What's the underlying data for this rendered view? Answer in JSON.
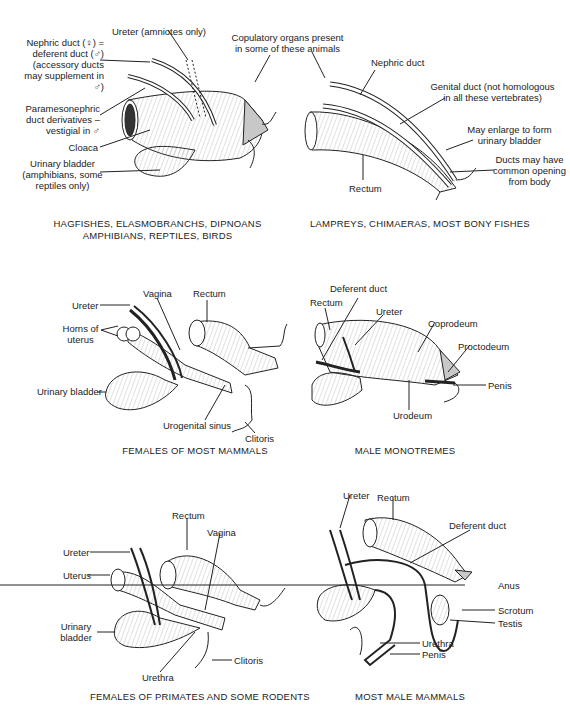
{
  "panels": [
    {
      "id": "nonmammal-tetrapods",
      "caption": "HAGFISHES, ELASMOBRANCHS, DIPNOANS\nAMPHIBIANS, REPTILES, BIRDS",
      "labels": {
        "ureter": "Ureter (amniotes only)",
        "nephric_duct": "Nephric duct (♀) =\ndeferent duct (♂)\n(accessory ducts\nmay supplement in ♂)",
        "paramesonephric": "Paramesonephric\nduct derivatives –\nvestigial in ♂",
        "cloaca": "Cloaca",
        "urinary_bladder": "Urinary bladder\n(amphibians, some\nreptiles only)"
      }
    },
    {
      "id": "fishes",
      "caption": "LAMPREYS, CHIMAERAS, MOST BONY FISHES",
      "labels": {
        "nephric_duct": "Nephric duct",
        "genital_duct": "Genital duct (not homologous\nin all these vertebrates)",
        "may_enlarge": "May enlarge to form\nurinary bladder",
        "ducts_common": "Ducts may have\ncommon opening\nfrom body",
        "rectum": "Rectum"
      }
    },
    {
      "id": "females-most-mammals",
      "caption": "FEMALES OF MOST MAMMALS",
      "labels": {
        "vagina": "Vagina",
        "rectum": "Rectum",
        "ureter": "Ureter",
        "horns": "Horns of\nuterus",
        "urinary_bladder": "Urinary bladder",
        "urogenital_sinus": "Urogenital sinus",
        "clitoris": "Clitoris"
      }
    },
    {
      "id": "male-monotremes",
      "caption": "MALE MONOTREMES",
      "labels": {
        "deferent_duct": "Deferent duct",
        "rectum": "Rectum",
        "ureter": "Ureter",
        "coprodeum": "Coprodeum",
        "proctodeum": "Proctodeum",
        "penis": "Penis",
        "urodeum": "Urodeum"
      }
    },
    {
      "id": "females-primates",
      "caption": "FEMALES OF PRIMATES AND SOME RODENTS",
      "labels": {
        "rectum": "Rectum",
        "vagina": "Vagina",
        "ureter": "Ureter",
        "uterus": "Uterus",
        "urinary_bladder": "Urinary\nbladder",
        "urethra": "Urethra",
        "clitoris": "Clitoris"
      }
    },
    {
      "id": "most-male-mammals",
      "caption": "MOST MALE MAMMALS",
      "labels": {
        "ureter": "Ureter",
        "rectum": "Rectum",
        "deferent_duct": "Deferent duct",
        "anus": "Anus",
        "scrotum": "Scrotum",
        "testis": "Testis",
        "urethra": "Urethra",
        "penis": "Penis"
      }
    }
  ],
  "shared": {
    "copulatory": "Copulatory organs present\nin some of these animals"
  },
  "colors": {
    "ink": "#222222",
    "shade": "#c8c8c8",
    "paper": "#ffffff"
  }
}
